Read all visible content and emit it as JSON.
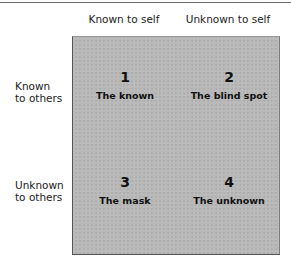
{
  "diagram": {
    "columns": [
      {
        "label": "Known to self"
      },
      {
        "label": "Unknown to self"
      }
    ],
    "rows": [
      {
        "label_line1": "Known",
        "label_line2": "to others"
      },
      {
        "label_line1": "Unknown",
        "label_line2": "to others"
      }
    ],
    "quadrants": [
      {
        "number": "1",
        "label": "The known"
      },
      {
        "number": "2",
        "label": "The blind spot"
      },
      {
        "number": "3",
        "label": "The mask"
      },
      {
        "number": "4",
        "label": "The unknown"
      }
    ],
    "colors": {
      "box_fill": "#b9b9b9",
      "text": "#111111",
      "rule": "#6e6e6e"
    }
  }
}
